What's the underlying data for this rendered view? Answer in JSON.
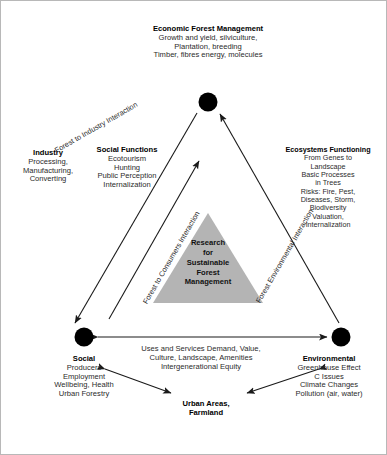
{
  "figure": {
    "nodes": {
      "economic": {
        "title": "Economic Forest Management",
        "lines": [
          "Growth and yield, silviculture,",
          "Plantation, breeding",
          "Timber, fibres energy, molecules"
        ]
      },
      "social": {
        "title": "Social",
        "lines": [
          "Producers",
          "Employment",
          "Wellbeing, Health",
          "Urban Forestry"
        ]
      },
      "environmental": {
        "title": "Environmental",
        "lines": [
          "Greenhouse Effect",
          "C Issues",
          "Climate Changes",
          "Pollution (air, water)"
        ]
      }
    },
    "side_blocks": {
      "industry": {
        "title": "Industry",
        "lines": [
          "Processing,",
          "Manufacturing,",
          "Converting"
        ]
      },
      "social_functions": {
        "title": "Social Functions",
        "lines": [
          "Ecotourism",
          "Hunting",
          "Public Perception",
          "Internalization"
        ]
      },
      "ecosystems_functioning": {
        "title": "Ecosystems Functioning",
        "lines": [
          "From Genes to",
          "Landscape",
          "Basic Processes",
          "in Trees",
          "Risks: Fire, Pest,",
          "Diseases, Storm,",
          "Biodiversity",
          "Valuation,",
          "Internalization"
        ]
      }
    },
    "center_triangle": {
      "lines": [
        "Research",
        "for",
        "Sustainable",
        "Forest",
        "Management"
      ],
      "fill_color": "#b4b4b4"
    },
    "edge_labels": {
      "forest_industry": "Forest to Industry Interaction",
      "forest_consumers": "Forest to Consumers Interaction",
      "forest_environmental": "Forest Environmental Interaction"
    },
    "bottom_flow": {
      "lines": [
        "Uses and Services Demand, Value,",
        "Culture, Landscape, Amenities",
        "Intergenerational Equity"
      ]
    },
    "bottom_node": {
      "title_lines": [
        "Urban Areas,",
        "Farmland"
      ]
    },
    "colors": {
      "line": "#1a1a1a",
      "node": "#000000",
      "border": "#b8b8b8"
    }
  }
}
